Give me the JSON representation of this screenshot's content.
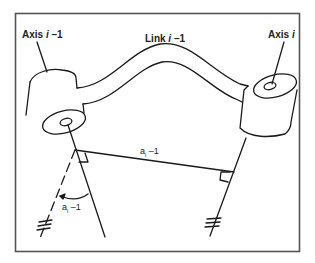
{
  "figure": {
    "labels": {
      "axis_prev": {
        "prefix": "Axis ",
        "var": "i",
        "suffix": " –1"
      },
      "axis_curr": {
        "prefix": "Axis ",
        "var": "i",
        "suffix": ""
      },
      "link": {
        "prefix": "Link ",
        "var": "i",
        "suffix": " –1"
      },
      "common_normal": {
        "base": "a",
        "sub": "i",
        "suffix": " –1"
      },
      "twist_angle": {
        "base": "a",
        "sub": "i",
        "suffix": " –1"
      }
    },
    "colors": {
      "stroke": "#1a1a1a",
      "frame": "#555555",
      "background": "#ffffff"
    }
  }
}
